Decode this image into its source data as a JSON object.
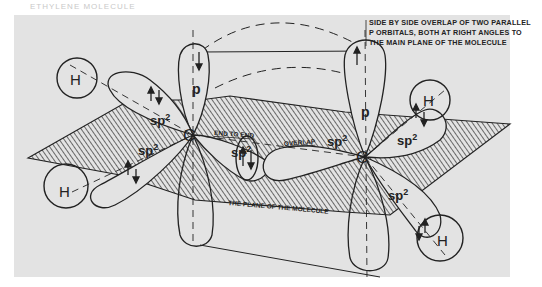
{
  "figure": {
    "header_faint_text": "ETHYLENE MOLECULE",
    "caption_lines": [
      "SIDE BY SIDE OVERLAP OF TWO PARALLEL",
      "P ORBITALS, BOTH AT RIGHT ANGLES TO",
      "THE MAIN PLANE OF THE MOLECULE"
    ],
    "labels": {
      "end_to_end": "END TO END",
      "overlap": "OVERLAP",
      "plane": "THE PLANE OF THE MOLECULE",
      "carbon": "C",
      "hydrogen": "H",
      "p_orbital": "p",
      "sp2": "sp",
      "sp2_sup": "2"
    }
  },
  "colors": {
    "background": "#e3e3e3",
    "ink": "#222222"
  }
}
